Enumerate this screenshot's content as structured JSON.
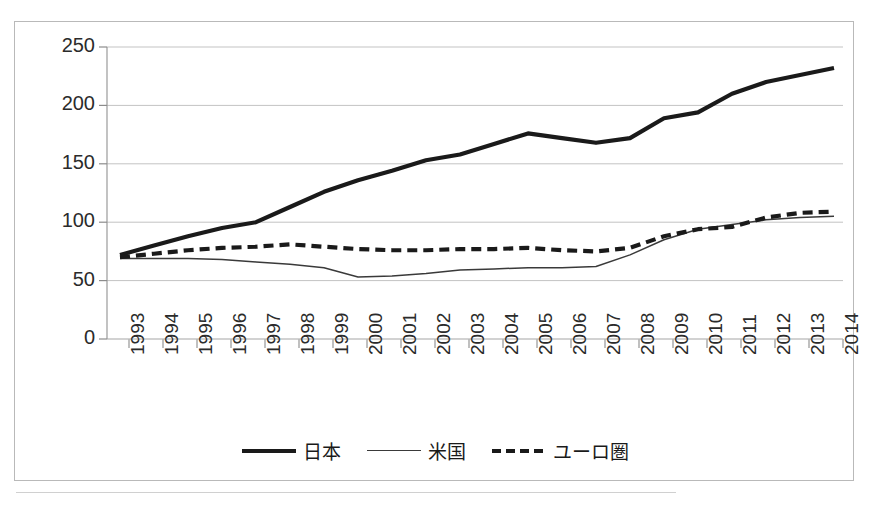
{
  "chart_data": {
    "type": "line",
    "title": "",
    "subtitle": "",
    "xlabel": "",
    "ylabel": "",
    "ylim": [
      0,
      250
    ],
    "yticks": [
      0,
      50,
      100,
      150,
      200,
      250
    ],
    "grid": true,
    "legend_position": "bottom",
    "categories": [
      "1993",
      "1994",
      "1995",
      "1996",
      "1997",
      "1998",
      "1999",
      "2000",
      "2001",
      "2002",
      "2003",
      "2004",
      "2005",
      "2006",
      "2007",
      "2008",
      "2009",
      "2010",
      "2011",
      "2012",
      "2013",
      "2014"
    ],
    "series": [
      {
        "name": "日本",
        "style": "thick-solid",
        "color": "#1a1a1a",
        "values": [
          72,
          80,
          88,
          95,
          100,
          113,
          126,
          136,
          144,
          153,
          158,
          167,
          176,
          172,
          168,
          172,
          189,
          194,
          210,
          220,
          226,
          232
        ]
      },
      {
        "name": "米国",
        "style": "thin-solid",
        "color": "#3a3a3a",
        "values": [
          69,
          69,
          69,
          68,
          66,
          64,
          61,
          53,
          54,
          56,
          59,
          60,
          61,
          61,
          62,
          72,
          85,
          94,
          98,
          102,
          104,
          105
        ]
      },
      {
        "name": "ユーロ圏",
        "style": "dashed",
        "color": "#1a1a1a",
        "values": [
          70,
          73,
          76,
          78,
          79,
          81,
          79,
          77,
          76,
          76,
          77,
          77,
          78,
          76,
          75,
          78,
          88,
          94,
          96,
          104,
          108,
          109
        ]
      }
    ]
  },
  "axes": {
    "y_tick_labels": [
      "250",
      "200",
      "150",
      "100",
      "50",
      "0"
    ],
    "x_tick_labels": [
      "1993",
      "1994",
      "1995",
      "1996",
      "1997",
      "1998",
      "1999",
      "2000",
      "2001",
      "2002",
      "2003",
      "2004",
      "2005",
      "2006",
      "2007",
      "2008",
      "2009",
      "2010",
      "2011",
      "2012",
      "2013",
      "2014"
    ]
  },
  "legend": {
    "items": [
      {
        "label": "日本",
        "style": "thick-solid"
      },
      {
        "label": "米国",
        "style": "thin-solid"
      },
      {
        "label": "ユーロ圏",
        "style": "dashed"
      }
    ]
  }
}
